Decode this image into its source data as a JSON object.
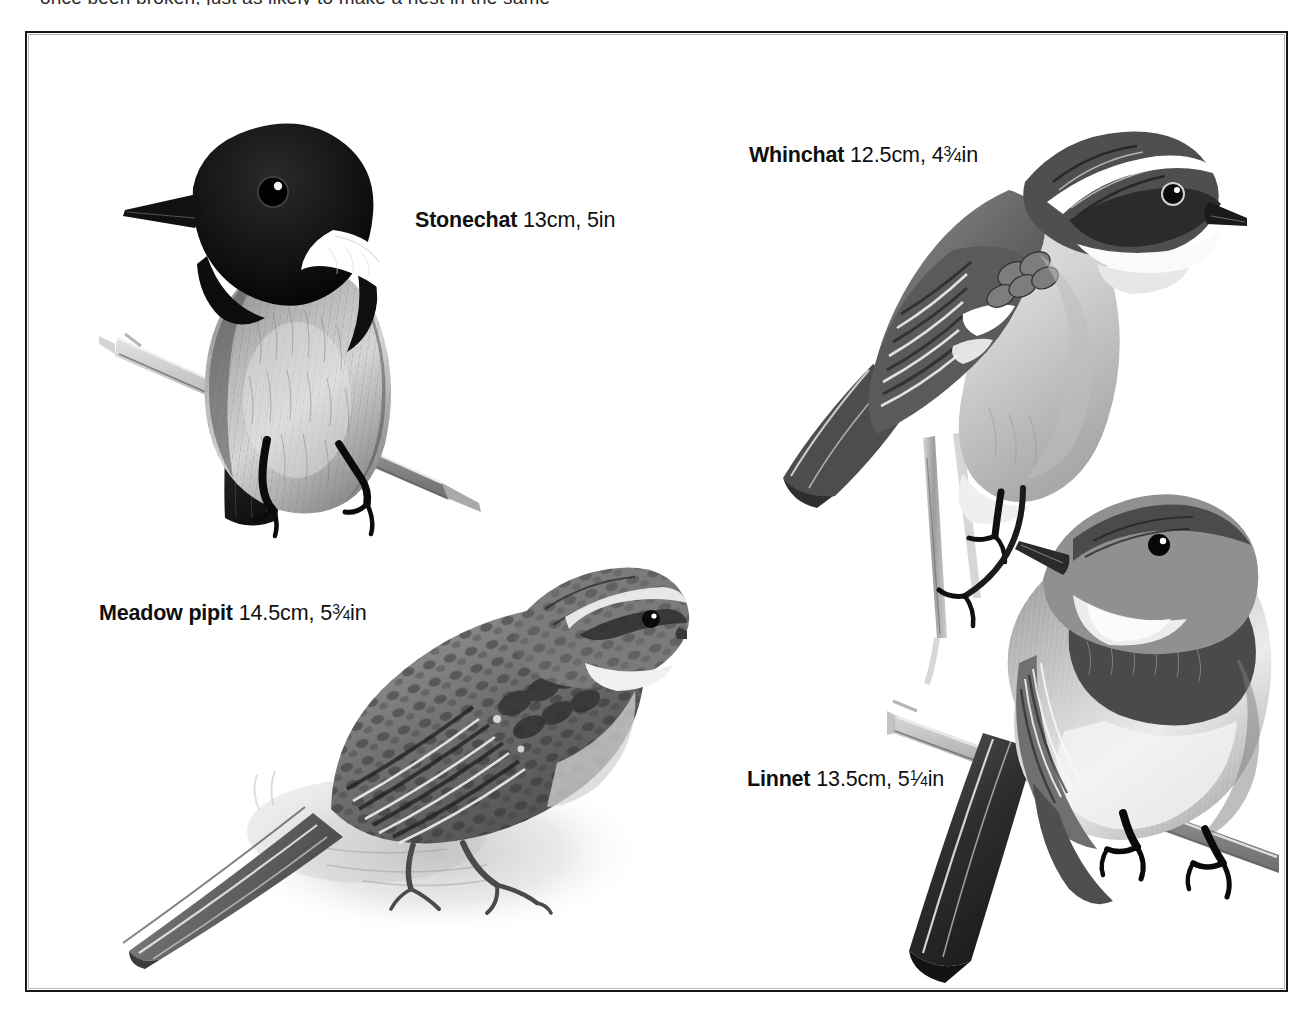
{
  "page": {
    "background_color": "#ffffff",
    "ink_color": "#111111",
    "bleed_text": "once  been  broken,  just  as  likely  to  make  a  nest  in  the  same"
  },
  "frame": {
    "name": "plate-border",
    "color": "#17171a",
    "line_width_px": 2
  },
  "plate": {
    "type": "field-guide-illustration-plate",
    "medium": "grayscale-watercolor-and-ink",
    "bird_count": 4
  },
  "labels": [
    {
      "id": "stonechat",
      "name": "Stonechat",
      "size_metric": "13cm",
      "size_imperial_whole": "5",
      "size_imperial_fraction": null,
      "size_imperial_unit": "in",
      "full_text": "Stonechat 13cm, 5in",
      "size_text": " 13cm, 5in"
    },
    {
      "id": "whinchat",
      "name": "Whinchat",
      "size_metric": "12.5cm",
      "size_imperial_whole": "4",
      "size_imperial_fraction": "3/4",
      "size_imperial_unit": "in",
      "full_text": "Whinchat 12.5cm, 4 3/4 in",
      "size_prefix": " 12.5cm, 4",
      "numerator": "3",
      "denominator": "4",
      "unit": "in"
    },
    {
      "id": "meadow-pipit",
      "name": "Meadow pipit",
      "size_metric": "14.5cm",
      "size_imperial_whole": "5",
      "size_imperial_fraction": "3/4",
      "size_imperial_unit": "in",
      "full_text": "Meadow pipit 14.5cm, 5 3/4 in",
      "size_prefix": " 14.5cm, 5",
      "numerator": "3",
      "denominator": "4",
      "unit": "in"
    },
    {
      "id": "linnet",
      "name": "Linnet",
      "size_metric": "13.5cm",
      "size_imperial_whole": "5",
      "size_imperial_fraction": "1/4",
      "size_imperial_unit": "in",
      "full_text": "Linnet 13.5cm, 5 1/4 in",
      "size_prefix": " 13.5cm, 5",
      "numerator": "1",
      "denominator": "4",
      "unit": "in"
    }
  ],
  "illustrations": [
    {
      "id": "stonechat",
      "subject": "Stonechat",
      "pose": "perched on diagonal branch, front-facing, head turned left",
      "features": [
        "black hood",
        "white neck collar",
        "mottled grey breast",
        "dark tail",
        "gripping claws"
      ],
      "position": "upper-left"
    },
    {
      "id": "whinchat",
      "subject": "Whinchat",
      "pose": "perched upright on thin vertical twig, facing right",
      "features": [
        "bold white supercilium",
        "dark eye-stripe",
        "streaked brown back",
        "white wing patch",
        "buff underparts"
      ],
      "position": "upper-right"
    },
    {
      "id": "meadow-pipit",
      "subject": "Meadow pipit",
      "pose": "standing on ground, facing right, long tail to lower-left",
      "features": [
        "heavily streaked upperparts",
        "pale supercilium",
        "long hind claw",
        "soft ground shadow wash"
      ],
      "position": "lower-left"
    },
    {
      "id": "linnet",
      "subject": "Linnet",
      "pose": "perched on angled stem, body front-on, head turned left",
      "features": [
        "grey head",
        "dark breast patch",
        "pale belly",
        "forked tail",
        "gripping claws"
      ],
      "position": "lower-right"
    }
  ]
}
